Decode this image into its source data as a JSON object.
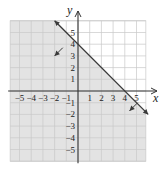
{
  "chart_data": {
    "type": "line",
    "title": "",
    "xlabel": "x",
    "ylabel": "y",
    "xlim": [
      -5.8,
      5.8
    ],
    "ylim": [
      -6,
      6
    ],
    "grid": true,
    "x_ticks": [
      -5,
      -4,
      -3,
      -2,
      -1,
      1,
      2,
      3,
      4,
      5
    ],
    "y_ticks": [
      -5,
      -4,
      -3,
      -2,
      -1,
      1,
      2,
      3,
      4,
      5
    ],
    "x_tick_labels": [
      "−5",
      "−4",
      "−3",
      "−2",
      "−1",
      "1",
      "2",
      "3",
      "4",
      "5"
    ],
    "y_tick_labels": [
      "−5",
      "−4",
      "−3",
      "−2",
      "−1",
      "1",
      "2",
      "3",
      "4",
      "5"
    ],
    "series": [
      {
        "name": "boundary line y = -x + 4",
        "style": "solid",
        "x": [
          -2,
          6
        ],
        "y": [
          6,
          -2
        ]
      }
    ],
    "shaded_region": {
      "description": "half-plane below/left of line (y <= -x + 4)",
      "inequality": "y <= -x + 4",
      "color": "#e3e3e3"
    },
    "shading_arrows": [
      {
        "from": [
          -1.3,
          3.7
        ],
        "to": [
          -2.0,
          3.0
        ]
      },
      {
        "from": [
          5.1,
          -1.0
        ],
        "to": [
          4.4,
          -1.7
        ]
      }
    ],
    "intercepts": {
      "x": 4,
      "y": 4
    }
  },
  "colors": {
    "shade": "#e3e3e3",
    "grid": "#c8c8c8",
    "axis": "#333333",
    "line": "#3a3a3a"
  }
}
